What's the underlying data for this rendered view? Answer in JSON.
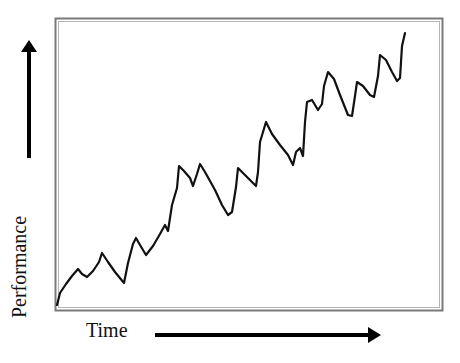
{
  "figure": {
    "type": "conceptual-diagram"
  },
  "axes": {
    "x_label": "Time",
    "y_label": "Performance",
    "x_arrow": "arrow-right",
    "y_arrow": "arrow-up"
  },
  "colors": {
    "line": "#111111",
    "frame": "#777777",
    "background": "#ffffff"
  },
  "chart_data": {
    "type": "line",
    "title": "",
    "xlabel": "Time",
    "ylabel": "Performance",
    "grid": false,
    "legend": null,
    "ticks": "none",
    "series": [
      {
        "name": "Performance",
        "points_px": [
          [
            57,
            305
          ],
          [
            60,
            293
          ],
          [
            66,
            284
          ],
          [
            72,
            276
          ],
          [
            78,
            269
          ],
          [
            82,
            274
          ],
          [
            87,
            277
          ],
          [
            93,
            271
          ],
          [
            99,
            262
          ],
          [
            102,
            253
          ],
          [
            108,
            262
          ],
          [
            115,
            272
          ],
          [
            124,
            283
          ],
          [
            128,
            263
          ],
          [
            133,
            244
          ],
          [
            136,
            238
          ],
          [
            140,
            245
          ],
          [
            146,
            255
          ],
          [
            153,
            246
          ],
          [
            160,
            234
          ],
          [
            165,
            225
          ],
          [
            168,
            231
          ],
          [
            172,
            205
          ],
          [
            177,
            188
          ],
          [
            179,
            166
          ],
          [
            184,
            171
          ],
          [
            190,
            178
          ],
          [
            193,
            186
          ],
          [
            197,
            174
          ],
          [
            200,
            164
          ],
          [
            205,
            172
          ],
          [
            215,
            190
          ],
          [
            222,
            205
          ],
          [
            228,
            215
          ],
          [
            232,
            212
          ],
          [
            236,
            187
          ],
          [
            238,
            168
          ],
          [
            245,
            175
          ],
          [
            256,
            186
          ],
          [
            258,
            172
          ],
          [
            260,
            142
          ],
          [
            266,
            122
          ],
          [
            272,
            134
          ],
          [
            280,
            145
          ],
          [
            288,
            155
          ],
          [
            293,
            165
          ],
          [
            296,
            152
          ],
          [
            300,
            148
          ],
          [
            303,
            156
          ],
          [
            305,
            122
          ],
          [
            307,
            102
          ],
          [
            312,
            100
          ],
          [
            318,
            110
          ],
          [
            322,
            104
          ],
          [
            324,
            86
          ],
          [
            328,
            72
          ],
          [
            334,
            79
          ],
          [
            340,
            95
          ],
          [
            348,
            115
          ],
          [
            352,
            116
          ],
          [
            355,
            96
          ],
          [
            357,
            82
          ],
          [
            363,
            86
          ],
          [
            370,
            95
          ],
          [
            374,
            97
          ],
          [
            378,
            76
          ],
          [
            380,
            55
          ],
          [
            386,
            60
          ],
          [
            392,
            72
          ],
          [
            397,
            81
          ],
          [
            400,
            78
          ],
          [
            402,
            46
          ],
          [
            405,
            33
          ]
        ]
      }
    ]
  }
}
